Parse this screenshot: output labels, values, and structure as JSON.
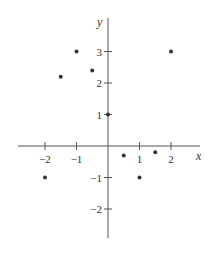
{
  "chart_data": {
    "type": "scatter",
    "title": "",
    "xlabel": "x",
    "ylabel": "y",
    "xlim": [
      -2.9,
      2.9
    ],
    "ylim": [
      -2.9,
      3.9
    ],
    "grid": false,
    "legend": null,
    "x_ticks": [
      -2,
      -1,
      1,
      2
    ],
    "y_ticks": [
      -2,
      -1,
      1,
      2,
      3
    ],
    "x_tick_labels": [
      "−2",
      "−1",
      "1",
      "2"
    ],
    "y_tick_labels": [
      "−2",
      "−1",
      "1",
      "2",
      "3"
    ],
    "points": [
      {
        "x": -2,
        "y": -1
      },
      {
        "x": -1,
        "y": 3
      },
      {
        "x": -1.5,
        "y": 2.2
      },
      {
        "x": -0.5,
        "y": 2.4
      },
      {
        "x": 0,
        "y": 1
      },
      {
        "x": 0.5,
        "y": -0.3
      },
      {
        "x": 1,
        "y": -1
      },
      {
        "x": 1.5,
        "y": -0.2
      },
      {
        "x": 2,
        "y": 3
      }
    ]
  },
  "layout": {
    "origin_px": [
      108,
      146
    ],
    "unit_px_x": 31.5,
    "unit_px_y": 31.5,
    "x_axis_px": [
      18,
      200
    ],
    "y_axis_px": [
      18,
      238
    ],
    "point_radius": 2,
    "color": "#333333"
  }
}
